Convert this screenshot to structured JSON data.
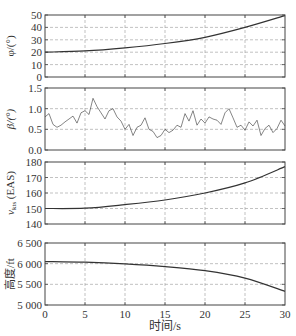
{
  "chart_data": [
    {
      "type": "line",
      "panel": "phi",
      "ylabel": "φ/(°)",
      "ylim": [
        0,
        50
      ],
      "yticks": [
        0,
        10,
        20,
        30,
        40,
        50
      ],
      "ytick_labels": [
        "0",
        "10",
        "20",
        "30",
        "40",
        "50"
      ],
      "grid": true,
      "x": [
        0,
        5,
        10,
        15,
        20,
        25,
        30
      ],
      "values": [
        20,
        21,
        23.5,
        27,
        32,
        40,
        49.5
      ]
    },
    {
      "type": "line",
      "panel": "beta",
      "ylabel": "β/(°)",
      "ylim": [
        0,
        1.5
      ],
      "yticks": [
        0,
        0.5,
        1.0,
        1.5
      ],
      "ytick_labels": [
        "0.0",
        "0.5",
        "1.0",
        "1.5"
      ],
      "grid": true,
      "note": "noisy signal fluctuating roughly between 0.3 and 1.25",
      "x": [
        0,
        0.5,
        1,
        1.5,
        2,
        2.5,
        3,
        3.5,
        4,
        4.5,
        5,
        5.5,
        6,
        6.5,
        7,
        7.5,
        8,
        8.5,
        9,
        9.5,
        10,
        10.5,
        11,
        11.5,
        12,
        12.5,
        13,
        13.5,
        14,
        14.5,
        15,
        15.5,
        16,
        16.5,
        17,
        17.5,
        18,
        18.5,
        19,
        19.5,
        20,
        20.5,
        21,
        21.5,
        22,
        22.5,
        23,
        23.5,
        24,
        24.5,
        25,
        25.5,
        26,
        26.5,
        27,
        27.5,
        28,
        28.5,
        29,
        29.5,
        30
      ],
      "values": [
        0.8,
        0.88,
        0.62,
        0.55,
        0.6,
        0.68,
        0.75,
        0.82,
        0.65,
        0.9,
        0.95,
        0.86,
        1.25,
        1.05,
        0.9,
        0.75,
        0.95,
        1.0,
        0.8,
        0.7,
        0.5,
        0.62,
        0.35,
        0.55,
        0.6,
        0.78,
        0.5,
        0.45,
        0.3,
        0.35,
        0.5,
        0.42,
        0.48,
        0.6,
        0.55,
        0.88,
        0.7,
        0.95,
        0.6,
        0.75,
        0.65,
        0.8,
        0.75,
        0.72,
        0.62,
        0.9,
        1.0,
        0.78,
        0.55,
        0.6,
        0.48,
        0.68,
        0.58,
        0.72,
        0.35,
        0.52,
        0.6,
        0.42,
        0.52,
        0.72,
        0.58
      ]
    },
    {
      "type": "line",
      "panel": "velocity",
      "ylabel": "v_kts(EAS)",
      "ylim": [
        140,
        180
      ],
      "yticks": [
        140,
        150,
        160,
        170,
        180
      ],
      "ytick_labels": [
        "140",
        "150",
        "160",
        "170",
        "180"
      ],
      "grid": true,
      "x": [
        0,
        5,
        10,
        15,
        20,
        25,
        30
      ],
      "values": [
        150,
        150.2,
        152.5,
        155.5,
        160,
        166.5,
        177
      ]
    },
    {
      "type": "line",
      "panel": "altitude",
      "ylabel": "高度/ft",
      "ylim": [
        5000,
        6500
      ],
      "yticks": [
        5000,
        5500,
        6000,
        6500
      ],
      "ytick_labels": [
        "5 000",
        "5 500",
        "6 000",
        "6 500"
      ],
      "grid": true,
      "x": [
        0,
        5,
        10,
        15,
        20,
        25,
        30
      ],
      "values": [
        6050,
        6035,
        5995,
        5930,
        5830,
        5650,
        5330
      ]
    }
  ],
  "xaxis": {
    "label": "时间/s",
    "xlim": [
      0,
      30
    ],
    "ticks": [
      0,
      5,
      10,
      15,
      20,
      25,
      30
    ],
    "tick_labels": [
      "0",
      "5",
      "10",
      "15",
      "20",
      "25",
      "30"
    ]
  },
  "labels": {
    "phi": "φ/(°)",
    "beta": "β/(°)",
    "velocity_main": "v",
    "velocity_sub": "kts",
    "velocity_suffix": " (EAS)",
    "altitude": "高度/ft",
    "xaxis": "时间/s"
  }
}
